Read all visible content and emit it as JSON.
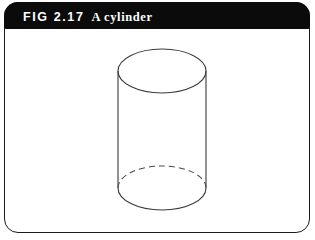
{
  "figure": {
    "caption": {
      "fig_number": "FIG 2.17",
      "title": "A cylinder"
    },
    "colors": {
      "caption_bar_background": "#0b0b0b",
      "caption_text": "#ffffff",
      "plate_background": "#ffffff",
      "frame_border": "#1b1b1b",
      "stroke": "#3a3a3a"
    },
    "diagram": {
      "type": "cylinder",
      "description": "Line drawing of a right circular cylinder shown in oblique view: a full solid ellipse forms the top face, two vertical side lines form the tube, and the bottom face is an ellipse whose rear arc is dashed (hidden) and whose front arc is solid.",
      "geometry": {
        "center_x": 157,
        "radius_x": 44,
        "radius_y": 22,
        "top_ellipse_center_y": 42,
        "bottom_ellipse_center_y": 159,
        "side_left_x": 113,
        "side_right_x": 201,
        "top_ellipse_top_y": 20,
        "bottom_ellipse_bottom_y": 181
      },
      "parts": [
        {
          "name": "top-face-ellipse",
          "style": "solid",
          "hidden": false
        },
        {
          "name": "left-side-line",
          "style": "solid",
          "hidden": false
        },
        {
          "name": "right-side-line",
          "style": "solid",
          "hidden": false
        },
        {
          "name": "bottom-face-front-arc",
          "style": "solid",
          "hidden": false
        },
        {
          "name": "bottom-face-back-arc",
          "style": "dashed",
          "hidden": true
        }
      ],
      "dash_pattern": "6 4"
    }
  }
}
